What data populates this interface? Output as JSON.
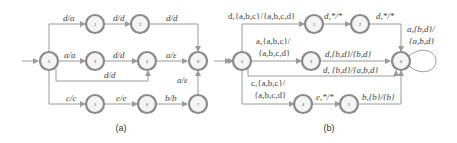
{
  "diagram_a": {
    "caption": "(a)",
    "nodes": [
      "0",
      "1",
      "2",
      "3",
      "4",
      "5",
      "6",
      "7",
      "8"
    ],
    "edges": [
      {
        "from": "0",
        "to": "1",
        "label": "d/a"
      },
      {
        "from": "1",
        "to": "2",
        "label": "d/d"
      },
      {
        "from": "2",
        "to": "8",
        "label": "d/d"
      },
      {
        "from": "0",
        "to": "3",
        "label": "a/a"
      },
      {
        "from": "3",
        "to": "4",
        "label": "d/d"
      },
      {
        "from": "4",
        "to": "8",
        "label": "a/ε"
      },
      {
        "from": "0",
        "to": "4",
        "label": "d/d"
      },
      {
        "from": "0",
        "to": "5",
        "label": "c/c"
      },
      {
        "from": "5",
        "to": "6",
        "label": "e/e"
      },
      {
        "from": "6",
        "to": "7",
        "label": "b/b"
      },
      {
        "from": "7",
        "to": "8",
        "label": "a/ε"
      }
    ]
  },
  "diagram_b": {
    "caption": "(b)",
    "nodes": [
      "0",
      "1",
      "2",
      "3",
      "4",
      "5",
      "6"
    ],
    "edges": [
      {
        "from": "0",
        "to": "1",
        "label": "d,{a,b,c}/{a,b,c,d}"
      },
      {
        "from": "1",
        "to": "2",
        "label": "d,*/*"
      },
      {
        "from": "2",
        "to": "6",
        "label": "d,*/*"
      },
      {
        "from": "0",
        "to": "3",
        "label_line1": "a,{a,b,c}/",
        "label_line2": "{a,b,c,d}"
      },
      {
        "from": "3",
        "to": "6",
        "label": "d,{b,d}/{b,d}"
      },
      {
        "from": "0",
        "to": "6",
        "label": "d, {b,d}/{a,b,d}"
      },
      {
        "from": "0",
        "to": "4",
        "label_line1": "c,{a,b,c}/",
        "label_line2": "{a,b,c,d}"
      },
      {
        "from": "4",
        "to": "5",
        "label": "e,*/*"
      },
      {
        "from": "5",
        "to": "6",
        "label": "b,{b}/{b}"
      },
      {
        "from": "6",
        "to": "6",
        "label_line1": "a,{b,d}/",
        "label_line2": "{a,b,d}"
      }
    ]
  }
}
